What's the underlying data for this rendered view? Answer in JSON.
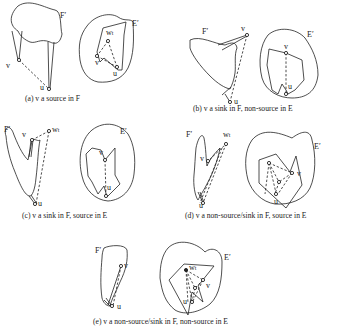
{
  "figure": {
    "panels": [
      {
        "id": "a",
        "caption": "(a) v a source in F",
        "F_label": "F′",
        "E_label": "E′",
        "F_points": {
          "v": "v",
          "u": "u"
        },
        "E_points": {
          "w": "w",
          "w_sub": "t",
          "v": "v",
          "u": "u"
        }
      },
      {
        "id": "b",
        "caption": "(b) v a sink in F, non-source in E",
        "F_label": "F′",
        "E_label": "E′",
        "F_points": {
          "v": "v",
          "u": "u"
        },
        "E_points": {
          "v": "v",
          "u": "u"
        }
      },
      {
        "id": "c",
        "caption": "(c) v a sink in F, source in E",
        "F_label": "F′",
        "E_label": "E′",
        "F_points": {
          "v": "v",
          "w": "w",
          "w_sub": "t",
          "u": "u"
        },
        "E_points": {
          "v": "v",
          "u": "u"
        }
      },
      {
        "id": "d",
        "caption": "(d) v a non-source/sink in F, source in E",
        "F_label": "F′",
        "E_label": "E′",
        "F_points": {
          "v": "v",
          "w": "w",
          "w_sub": "t",
          "u": "u"
        },
        "E_points": {
          "v": "v",
          "u": "u"
        }
      },
      {
        "id": "e",
        "caption": "(e) v a non-source/sink in F, non-source in E",
        "F_label": "F′",
        "E_label": "E′",
        "F_points": {
          "v": "v",
          "u": "u"
        },
        "E_points": {
          "w": "w",
          "w_sub": "t",
          "v": "v",
          "u": "u"
        }
      }
    ]
  }
}
